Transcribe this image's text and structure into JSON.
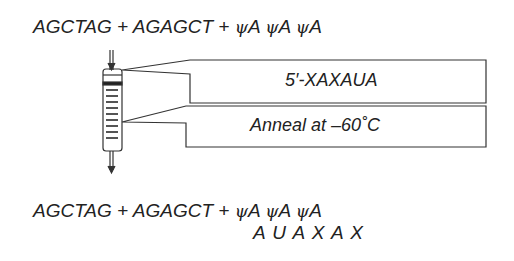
{
  "top_equation": {
    "part1": "AGCTAG + AGAGCT +",
    "psi": "ψ",
    "a": "A"
  },
  "boxes": [
    {
      "text": "5′-XAXAUA"
    },
    {
      "text": "Anneal at –60˚C"
    }
  ],
  "bottom_equation": {
    "part1": "AGCTAG + AGAGCT +",
    "psi": "ψ",
    "a": "A",
    "line2": "A U A X A X"
  }
}
